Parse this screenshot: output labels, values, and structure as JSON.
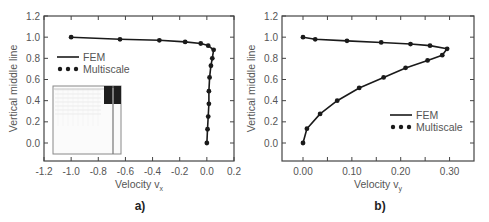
{
  "chart_data": [
    {
      "id": "a",
      "type": "line",
      "panel_label": "a)",
      "xlabel": "Velocity v",
      "xlabel_sub": "x",
      "ylabel": "Vertical middle line",
      "xlim": [
        -1.2,
        0.2
      ],
      "ylim": [
        -0.17,
        1.2
      ],
      "xticks": [
        -1.2,
        -1.0,
        -0.8,
        -0.6,
        -0.4,
        -0.2,
        0.0,
        0.2
      ],
      "xtick_labels": [
        "-1.2",
        "-1.0",
        "-0.8",
        "-0.6",
        "-0.4",
        "-0.2",
        "0.0",
        "0.2"
      ],
      "yticks": [
        0.0,
        0.2,
        0.4,
        0.6,
        0.8,
        1.0,
        1.2
      ],
      "ytick_labels": [
        "0.0",
        "0.2",
        "0.4",
        "0.6",
        "0.8",
        "1.0",
        "1.2"
      ],
      "grid": false,
      "legend": {
        "position": "upper-left",
        "entries": [
          "FEM",
          "Multiscale"
        ]
      },
      "has_inset": true,
      "series": [
        {
          "name": "FEM",
          "style": "line",
          "x": [
            -1.0,
            -0.64,
            -0.35,
            -0.16,
            -0.045,
            0.01,
            0.05,
            0.04,
            0.03,
            0.02,
            0.015,
            0.015,
            0.01,
            0.005,
            0.0
          ],
          "y": [
            1.0,
            0.98,
            0.97,
            0.955,
            0.94,
            0.92,
            0.88,
            0.8,
            0.73,
            0.62,
            0.49,
            0.37,
            0.25,
            0.13,
            0.0
          ]
        },
        {
          "name": "Multiscale",
          "style": "markers",
          "x": [
            -1.0,
            -0.64,
            -0.35,
            -0.16,
            -0.045,
            0.01,
            0.05,
            0.04,
            0.03,
            0.02,
            0.015,
            0.015,
            0.01,
            0.005,
            0.0
          ],
          "y": [
            1.0,
            0.98,
            0.97,
            0.955,
            0.94,
            0.92,
            0.88,
            0.8,
            0.73,
            0.62,
            0.49,
            0.37,
            0.25,
            0.13,
            0.0
          ]
        }
      ]
    },
    {
      "id": "b",
      "type": "line",
      "panel_label": "b)",
      "xlabel": "Velocity v",
      "xlabel_sub": "y",
      "ylabel": "Vertical middle line",
      "xlim": [
        -0.043,
        0.35
      ],
      "ylim": [
        -0.17,
        1.2
      ],
      "xticks": [
        0.0,
        0.05,
        0.1,
        0.15,
        0.2,
        0.25,
        0.3
      ],
      "xtick_labels": [
        "0.00",
        "",
        "0.10",
        "",
        "0.20",
        "",
        "0.30"
      ],
      "yticks": [
        0.0,
        0.2,
        0.4,
        0.6,
        0.8,
        1.0,
        1.2
      ],
      "ytick_labels": [
        "0.0",
        "0.2",
        "0.4",
        "0.6",
        "0.8",
        "1.0",
        "1.2"
      ],
      "grid": false,
      "legend": {
        "position": "lower-right",
        "entries": [
          "FEM",
          "Multiscale"
        ]
      },
      "has_inset": false,
      "series": [
        {
          "name": "FEM",
          "style": "line",
          "x": [
            0.0,
            0.025,
            0.09,
            0.16,
            0.22,
            0.26,
            0.295,
            0.285,
            0.255,
            0.21,
            0.165,
            0.115,
            0.07,
            0.035,
            0.008,
            0.0
          ],
          "y": [
            1.0,
            0.98,
            0.965,
            0.95,
            0.935,
            0.92,
            0.89,
            0.83,
            0.78,
            0.71,
            0.62,
            0.52,
            0.4,
            0.275,
            0.135,
            0.0
          ]
        },
        {
          "name": "Multiscale",
          "style": "markers",
          "x": [
            0.0,
            0.025,
            0.09,
            0.16,
            0.22,
            0.26,
            0.295,
            0.285,
            0.255,
            0.21,
            0.165,
            0.115,
            0.07,
            0.035,
            0.008,
            0.0
          ],
          "y": [
            1.0,
            0.98,
            0.965,
            0.95,
            0.935,
            0.92,
            0.89,
            0.83,
            0.78,
            0.71,
            0.62,
            0.52,
            0.4,
            0.275,
            0.135,
            0.0
          ]
        }
      ]
    }
  ],
  "layout": {
    "panels": [
      {
        "id": "a",
        "plot_box": {
          "x0": 44,
          "y0": 16,
          "x1": 234,
          "y1": 161
        },
        "legend_xy": [
          57,
          57
        ],
        "panel_label_xy": [
          140,
          210
        ],
        "xlabel_xy": [
          139,
          188
        ]
      },
      {
        "id": "b",
        "plot_box": {
          "x0": 282,
          "y0": 16,
          "x1": 474,
          "y1": 161
        },
        "legend_xy": [
          390,
          115
        ],
        "panel_label_xy": [
          380,
          210
        ],
        "xlabel_xy": [
          378,
          188
        ]
      }
    ],
    "inset": {
      "x": 53,
      "y": 86,
      "w": 68,
      "h": 68,
      "dark_block": {
        "x": 104,
        "y": 86,
        "w": 17,
        "h": 18
      },
      "line_x": 113
    },
    "colors": {
      "axis": "#444444",
      "line": "#1a1a1a",
      "marker": "#1a1a1a",
      "text": "#555555",
      "inset_border": "#888888",
      "inset_dark": "#1e1e1e"
    }
  }
}
